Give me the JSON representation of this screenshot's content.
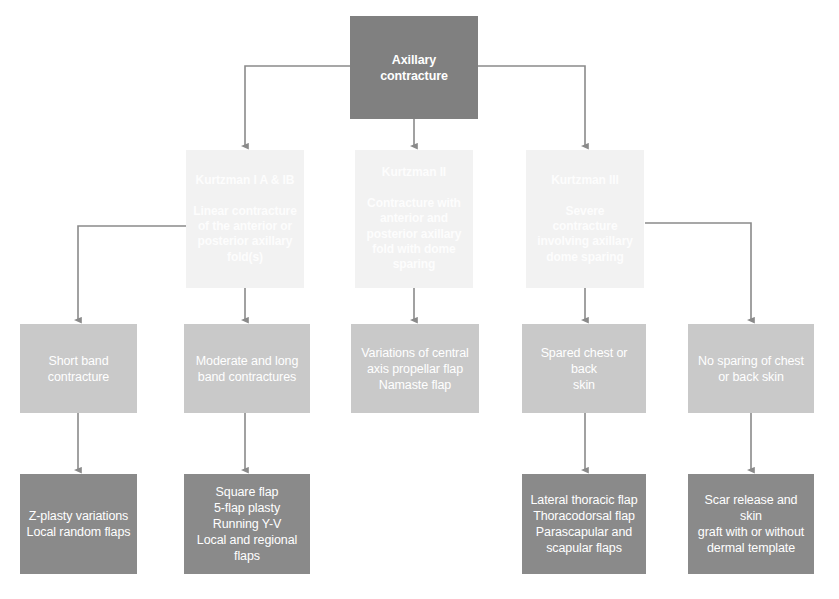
{
  "diagram": {
    "colors": {
      "root_fill": "#808080",
      "level2_fill": "#f2f2f2",
      "level3_fill": "#c9c9c9",
      "level4_fill": "#8a8a8a",
      "connector": "#808080",
      "text_on_dark": "#ffffff"
    },
    "nodes": {
      "root": "Axillary\ncontracture",
      "kurtzman_1": "Kurtzman I A & IB\n\nLinear contracture\nof the anterior or\nposterior axillary\nfold(s)",
      "kurtzman_2": "Kurtzman II\n\nContracture with\nanterior and\nposterior axillary\nfold with dome\nsparing",
      "kurtzman_3": "Kurtzman III\n\nSevere contracture\ninvolving axillary\ndome sparing",
      "short_band": "Short band\ncontracture",
      "moderate_long_band": "Moderate and long\nband contractures",
      "central_axis": "Variations of central\naxis propellar flap\nNamaste flap",
      "spared_skin": "Spared chest or back\nskin",
      "no_sparing": "No sparing of chest\nor back skin",
      "zplasty": "Z-plasty variations\nLocal random flaps",
      "square_flap": "Square flap\n5-flap plasty\nRunning Y-V\nLocal and regional\nflaps",
      "thoracic_flaps": "Lateral thoracic  flap\nThoracodorsal flap\nParascapular and\nscapular flaps",
      "scar_release": "Scar release and skin\ngraft with or without\ndermal template"
    }
  }
}
